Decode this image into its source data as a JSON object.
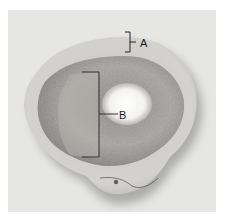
{
  "figure": {
    "labels": [
      {
        "id": "A",
        "text": "A"
      },
      {
        "id": "B",
        "text": "B"
      }
    ],
    "colors": {
      "background": "#e6e6e4",
      "outer_rim": "#d2d0cc",
      "spongy_region": "#9c9a96",
      "cavity": "#f4f4f2",
      "label_ink": "#1a1a1a"
    }
  }
}
